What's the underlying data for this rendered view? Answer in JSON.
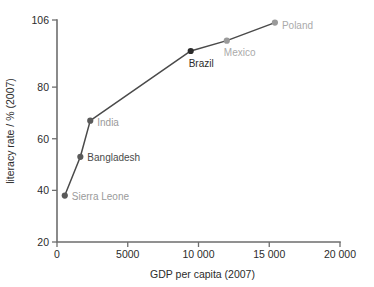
{
  "chart_data": {
    "type": "scatter",
    "title": "",
    "subtitle": "",
    "xlabel": "GDP per capita (2007)",
    "ylabel": "literacy rate / % (2007)",
    "xlim": [
      0,
      20000
    ],
    "ylim": [
      20,
      106
    ],
    "grid": false,
    "legend": "none",
    "connected": true,
    "x_ticks": [
      {
        "value": 0,
        "label": "0"
      },
      {
        "value": 5000,
        "label": "5000"
      },
      {
        "value": 10000,
        "label": "10 000"
      },
      {
        "value": 15000,
        "label": "15 000"
      },
      {
        "value": 20000,
        "label": "20 000"
      }
    ],
    "y_ticks": [
      {
        "value": 20,
        "label": "20"
      },
      {
        "value": 40,
        "label": "40"
      },
      {
        "value": 60,
        "label": "60"
      },
      {
        "value": 80,
        "label": "80"
      },
      {
        "value": 106,
        "label": "106"
      }
    ],
    "points": [
      {
        "name": "Sierra Leone",
        "x": 550,
        "y": 38,
        "label": "Sierra Leone",
        "color": "#9a9a9a",
        "marker_color": "#5a5a5a",
        "label_dx": 7,
        "label_dy": 4,
        "anchor": "start"
      },
      {
        "name": "Bangladesh",
        "x": 1650,
        "y": 53,
        "label": "Bangladesh",
        "color": "#4a4a4a",
        "marker_color": "#5a5a5a",
        "label_dx": 7,
        "label_dy": 4,
        "anchor": "start"
      },
      {
        "name": "India",
        "x": 2350,
        "y": 67,
        "label": "India",
        "color": "#9a9a9a",
        "marker_color": "#5a5a5a",
        "label_dx": 7,
        "label_dy": 5,
        "anchor": "start"
      },
      {
        "name": "Brazil",
        "x": 9450,
        "y": 94,
        "label": "Brazil",
        "color": "#2b2b2b",
        "marker_color": "#2b2b2b",
        "label_dx": -2,
        "label_dy": 16,
        "anchor": "start"
      },
      {
        "name": "Mexico",
        "x": 12000,
        "y": 98,
        "label": "Mexico",
        "color": "#aaaaaa",
        "marker_color": "#9a9a9a",
        "label_dx": -3,
        "label_dy": 15,
        "anchor": "start"
      },
      {
        "name": "Poland",
        "x": 15400,
        "y": 105,
        "label": "Poland",
        "color": "#aaaaaa",
        "marker_color": "#9a9a9a",
        "label_dx": 7,
        "label_dy": 6,
        "anchor": "start"
      }
    ],
    "series": [
      {
        "name": "literacy vs GDP",
        "categories": [
          "Sierra Leone",
          "Bangladesh",
          "India",
          "Brazil",
          "Mexico",
          "Poland"
        ],
        "x": [
          550,
          1650,
          2350,
          9450,
          12000,
          15400
        ],
        "values": [
          38,
          53,
          67,
          94,
          98,
          105
        ]
      }
    ],
    "colors": {
      "axis": "#6e6e6e",
      "line": "#4a4a4a",
      "text": "#2b2b2b",
      "muted_text": "#9a9a9a"
    }
  }
}
